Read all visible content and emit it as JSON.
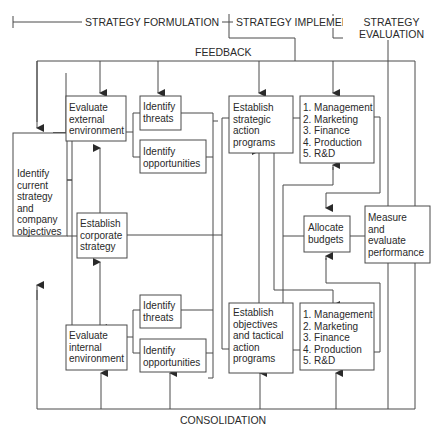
{
  "phases": {
    "formulation": "STRATEGY\nFORMULATION",
    "implementation": "STRATEGY\nIMPLEMENTATION",
    "evaluation": "STRATEGY\nEVALUATION"
  },
  "loops": {
    "top": "FEEDBACK",
    "bottom": "CONSOLIDATION"
  },
  "boxes": {
    "current_strategy": "Identify\ncurrent\nstrategy\nand\ncompany\nobjectives",
    "eval_external": "Evaluate\nexternal\nenvironment",
    "threats_top": "Identify\nthreats",
    "opportunities_top": "Identify\nopportunities",
    "corporate_strategy": "Establish\ncorporate\nstrategy",
    "eval_internal": "Evaluate\ninternal\nenvironment",
    "threats_bottom": "Identify\nthreats",
    "opportunities_bottom": "Identify\nopportunities",
    "strategic_programs": "Establish\nstrategic\naction\nprograms",
    "tactical_programs": "Establish\nobjectives\nand tactical\naction\nprograms",
    "functions_top": "1. Management\n2. Marketing\n3. Finance\n4. Production\n5. R&D",
    "functions_bottom": "1. Management\n2. Marketing\n3. Finance\n4. Production\n5. R&D",
    "allocate_budgets": "Allocate\nbudgets",
    "measure_performance": "Measure\nand\nevaluate\nperformance"
  },
  "colors": {
    "line": "#4a4a4a",
    "text": "#2a2a2a",
    "background": "#ffffff"
  }
}
